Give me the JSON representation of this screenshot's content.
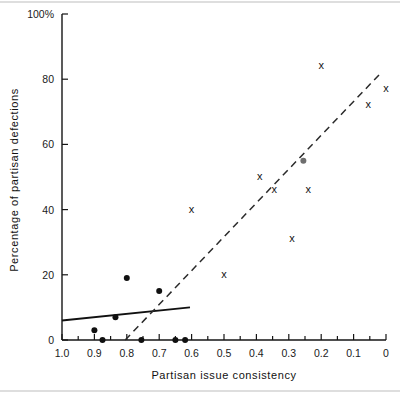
{
  "chart_data": {
    "type": "scatter",
    "title": "",
    "xlabel": "Partisan issue consistency",
    "ylabel": "Percentage of partisan defections",
    "xlim": [
      1.0,
      0.0
    ],
    "ylim": [
      0,
      100
    ],
    "x_axis_reversed": true,
    "grid": false,
    "legend": null,
    "xticks": [
      {
        "value": 1.0,
        "label": "1.0"
      },
      {
        "value": 0.9,
        "label": "0.9"
      },
      {
        "value": 0.8,
        "label": "0.8"
      },
      {
        "value": 0.7,
        "label": "0.7"
      },
      {
        "value": 0.6,
        "label": "0.6"
      },
      {
        "value": 0.5,
        "label": "0.5"
      },
      {
        "value": 0.4,
        "label": "0.4"
      },
      {
        "value": 0.3,
        "label": "0.3"
      },
      {
        "value": 0.2,
        "label": "0.2"
      },
      {
        "value": 0.1,
        "label": "0.1"
      },
      {
        "value": 0.0,
        "label": "0"
      }
    ],
    "xticks_minor": [
      0.95,
      0.85,
      0.75,
      0.65,
      0.55,
      0.45,
      0.35,
      0.25,
      0.15,
      0.05
    ],
    "yticks": [
      {
        "value": 100,
        "label": "100%"
      },
      {
        "value": 80,
        "label": "80"
      },
      {
        "value": 60,
        "label": "60"
      },
      {
        "value": 40,
        "label": "40"
      },
      {
        "value": 20,
        "label": "20"
      },
      {
        "value": 0,
        "label": "0"
      }
    ],
    "series": [
      {
        "name": "dot-series",
        "marker": "filled-circle",
        "color": "#101010",
        "points": [
          {
            "x": 0.9,
            "y": 3
          },
          {
            "x": 0.875,
            "y": 0
          },
          {
            "x": 0.835,
            "y": 7
          },
          {
            "x": 0.8,
            "y": 19
          },
          {
            "x": 0.755,
            "y": 0
          },
          {
            "x": 0.7,
            "y": 15
          },
          {
            "x": 0.65,
            "y": 0
          },
          {
            "x": 0.62,
            "y": 0
          }
        ]
      },
      {
        "name": "dot-series-grey",
        "marker": "filled-circle",
        "color": "#6e6e6e",
        "points": [
          {
            "x": 0.255,
            "y": 55
          }
        ]
      },
      {
        "name": "x-series",
        "marker": "x",
        "color": "#141414",
        "points": [
          {
            "x": 0.6,
            "y": 40
          },
          {
            "x": 0.5,
            "y": 20
          },
          {
            "x": 0.39,
            "y": 50
          },
          {
            "x": 0.345,
            "y": 46
          },
          {
            "x": 0.29,
            "y": 31
          },
          {
            "x": 0.24,
            "y": 46
          },
          {
            "x": 0.2,
            "y": 84
          },
          {
            "x": 0.055,
            "y": 72
          },
          {
            "x": 0.0,
            "y": 77
          }
        ]
      }
    ],
    "fit_lines": [
      {
        "name": "solid-fit-line",
        "style": "solid",
        "x_start": 1.0,
        "y_start": 6,
        "x_end": 0.605,
        "y_end": 10
      },
      {
        "name": "dashed-fit-line",
        "style": "dashed",
        "x_start": 0.805,
        "y_start": 0,
        "x_end": 0.015,
        "y_end": 82
      }
    ]
  }
}
